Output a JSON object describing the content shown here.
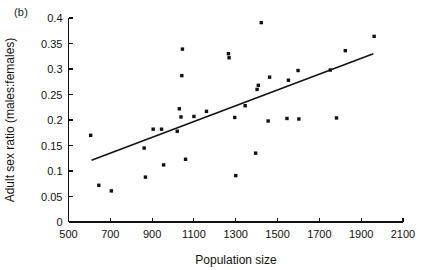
{
  "figure": {
    "panel_label": "(b)",
    "background_color": "#ffffff",
    "ink_color": "#111111"
  },
  "chart_data": {
    "type": "scatter",
    "title": "",
    "subtitle": "",
    "panel": "(b)",
    "xlabel": "Population size",
    "ylabel": "Adult sex ratio (males:females)",
    "xlim": [
      500,
      2100
    ],
    "ylim": [
      0,
      0.4
    ],
    "xticks": [
      500,
      700,
      900,
      1100,
      1300,
      1500,
      1700,
      1900,
      2100
    ],
    "xtick_labels": [
      "500",
      "700",
      "900",
      "1100",
      "1300",
      "1500",
      "1700",
      "1900",
      "2100"
    ],
    "yticks": [
      0,
      0.05,
      0.1,
      0.15,
      0.2,
      0.25,
      0.3,
      0.35,
      0.4
    ],
    "ytick_labels": [
      "0",
      "0.05",
      "0.1",
      "0.15",
      "0.2",
      "0.25",
      "0.3",
      "0.35",
      "0.4"
    ],
    "grid": false,
    "legend": null,
    "legend_position": "none",
    "marker": "square",
    "marker_color": "#111111",
    "points": [
      {
        "x": 606,
        "y": 0.17
      },
      {
        "x": 645,
        "y": 0.072
      },
      {
        "x": 705,
        "y": 0.061
      },
      {
        "x": 862,
        "y": 0.145
      },
      {
        "x": 868,
        "y": 0.088
      },
      {
        "x": 905,
        "y": 0.182
      },
      {
        "x": 945,
        "y": 0.182
      },
      {
        "x": 955,
        "y": 0.112
      },
      {
        "x": 1020,
        "y": 0.178
      },
      {
        "x": 1030,
        "y": 0.222
      },
      {
        "x": 1038,
        "y": 0.206
      },
      {
        "x": 1042,
        "y": 0.287
      },
      {
        "x": 1045,
        "y": 0.339
      },
      {
        "x": 1060,
        "y": 0.123
      },
      {
        "x": 1100,
        "y": 0.207
      },
      {
        "x": 1160,
        "y": 0.217
      },
      {
        "x": 1265,
        "y": 0.33
      },
      {
        "x": 1268,
        "y": 0.322
      },
      {
        "x": 1295,
        "y": 0.205
      },
      {
        "x": 1300,
        "y": 0.091
      },
      {
        "x": 1345,
        "y": 0.228
      },
      {
        "x": 1395,
        "y": 0.135
      },
      {
        "x": 1402,
        "y": 0.26
      },
      {
        "x": 1408,
        "y": 0.268
      },
      {
        "x": 1422,
        "y": 0.391
      },
      {
        "x": 1455,
        "y": 0.198
      },
      {
        "x": 1462,
        "y": 0.284
      },
      {
        "x": 1545,
        "y": 0.203
      },
      {
        "x": 1552,
        "y": 0.278
      },
      {
        "x": 1598,
        "y": 0.297
      },
      {
        "x": 1602,
        "y": 0.202
      },
      {
        "x": 1752,
        "y": 0.298
      },
      {
        "x": 1782,
        "y": 0.204
      },
      {
        "x": 1824,
        "y": 0.336
      },
      {
        "x": 1962,
        "y": 0.364
      }
    ],
    "trendline": {
      "type": "linear-fit",
      "x_start": 610,
      "y_start": 0.121,
      "x_end": 1958,
      "y_end": 0.33
    }
  }
}
